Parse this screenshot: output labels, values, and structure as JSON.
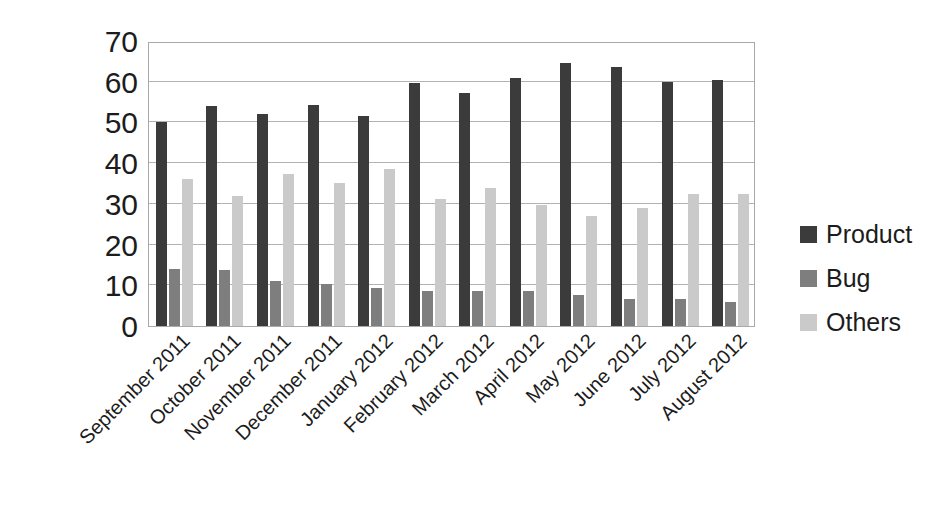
{
  "chart_data": {
    "type": "bar",
    "title": "",
    "subtitle": "",
    "xlabel": "",
    "ylabel": "",
    "ylim": [
      0,
      70
    ],
    "ytick_step": 10,
    "yticks": [
      "70",
      "60",
      "50",
      "40",
      "30",
      "20",
      "10",
      "0"
    ],
    "grid": true,
    "legend_position": "right",
    "categories": [
      "September 2011",
      "October 2011",
      "November 2011",
      "December 2011",
      "January 2012",
      "February 2012",
      "March 2012",
      "April 2012",
      "May 2012",
      "June 2012",
      "July 2012",
      "August 2012"
    ],
    "series": [
      {
        "name": "Product",
        "color": "#3b3b3b",
        "values": [
          50,
          54,
          52,
          54.3,
          51.7,
          59.7,
          57.2,
          61,
          64.6,
          63.7,
          60,
          60.5
        ]
      },
      {
        "name": "Bug",
        "color": "#7e7e7e",
        "values": [
          14,
          13.7,
          11,
          10.2,
          9.4,
          8.6,
          8.6,
          8.6,
          7.5,
          6.6,
          6.6,
          5.8
        ]
      },
      {
        "name": "Others",
        "color": "#cacaca",
        "values": [
          36,
          32,
          37.3,
          35.2,
          38.6,
          31.2,
          34,
          29.7,
          27.1,
          28.9,
          32.5,
          32.5
        ]
      }
    ]
  },
  "legend": {
    "items": [
      {
        "label": "Product",
        "swatch": "product"
      },
      {
        "label": "Bug",
        "swatch": "bug"
      },
      {
        "label": "Others",
        "swatch": "others"
      }
    ]
  }
}
